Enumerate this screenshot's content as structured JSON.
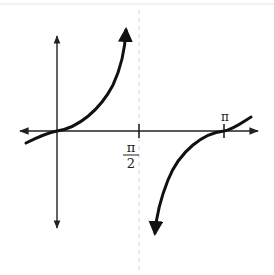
{
  "figure": {
    "colors": {
      "curve": "#111111",
      "axis": "#222222",
      "asymptote": "#c8c8c8",
      "background": "#ffffff"
    },
    "labels": {
      "half_pi_numerator": "π",
      "half_pi_denominator": "2",
      "pi": "π"
    },
    "x_ticks": [
      {
        "name": "pi-over-2",
        "label": "π/2"
      },
      {
        "name": "pi",
        "label": "π"
      }
    ],
    "asymptote": {
      "x": "π/2",
      "style": "dashed"
    }
  }
}
